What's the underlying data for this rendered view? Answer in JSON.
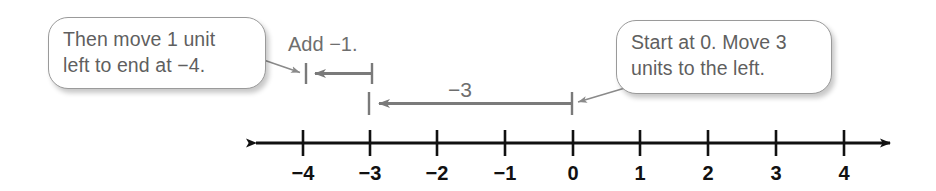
{
  "diagram": {
    "colors": {
      "axis": "#111111",
      "callout_border": "#9a9a9a",
      "callout_text": "#5f5f5f",
      "jump_arrow": "#7a7a7a",
      "leader_line": "#8a8a8a",
      "tick_label": "#111111",
      "background": "#ffffff"
    },
    "callouts": [
      {
        "id": "callout-left",
        "text": "Then move 1 unit\nleft to end at −4.",
        "points_to": "add-neg-1-jump"
      },
      {
        "id": "callout-right",
        "text": "Start at 0. Move 3\nunits to the left.",
        "points_to": "move-neg-3-jump"
      }
    ],
    "jump_labels": [
      {
        "id": "label-add-neg1",
        "text": "Add −1."
      },
      {
        "id": "label-neg3",
        "text": "−3"
      }
    ],
    "jumps": [
      {
        "id": "add-neg-1-jump",
        "label": "Add −1.",
        "from": 0,
        "to": -1,
        "offset_from": -3,
        "offset_to": -4,
        "direction": "left",
        "magnitude": 1
      },
      {
        "id": "move-neg-3-jump",
        "label": "−3",
        "from": 0,
        "to": -3,
        "direction": "left",
        "magnitude": 3
      }
    ],
    "number_line": {
      "min": -4,
      "max": 4,
      "step": 1,
      "tick_labels": [
        "−4",
        "−3",
        "−2",
        "−1",
        "0",
        "1",
        "2",
        "3",
        "4"
      ],
      "tick_values": [
        -4,
        -3,
        -2,
        -1,
        0,
        1,
        2,
        3,
        4
      ],
      "has_left_arrowhead": true,
      "has_right_arrowhead": true
    }
  }
}
